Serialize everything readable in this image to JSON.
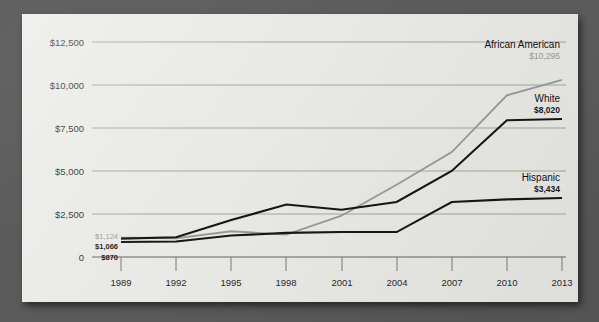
{
  "chart_data": {
    "type": "line",
    "title": "",
    "subtitle": "",
    "xlabel": "",
    "ylabel": "",
    "x": [
      1989,
      1992,
      1995,
      1998,
      2001,
      2004,
      2007,
      2010,
      2013
    ],
    "xtick_labels": [
      "1989",
      "1992",
      "1995",
      "1998",
      "2001",
      "2004",
      "2007",
      "2010",
      "2013"
    ],
    "ytick_labels": [
      "$12,500",
      "$10,000",
      "$7,500",
      "$5,000",
      "$2,500",
      "0"
    ],
    "ytick_values": [
      12500,
      10000,
      7500,
      5000,
      2500,
      0
    ],
    "ylim": [
      0,
      13500
    ],
    "grid": true,
    "legend_position": "inline-right-end-labels",
    "series": [
      {
        "name": "African American",
        "color": "#9a9a97",
        "values": [
          1124,
          1090,
          1500,
          1300,
          2400,
          4200,
          6100,
          9400,
          10295
        ],
        "start_label": "$1,124",
        "end_label": "$10,295"
      },
      {
        "name": "White",
        "color": "#161616",
        "values": [
          1066,
          1150,
          2150,
          3050,
          2750,
          3200,
          5000,
          7950,
          8020
        ],
        "start_label": "$1,066",
        "end_label": "$8,020"
      },
      {
        "name": "Hispanic",
        "color": "#161616",
        "values": [
          870,
          900,
          1250,
          1400,
          1450,
          1450,
          3200,
          3350,
          3434
        ],
        "start_label": "$870",
        "end_label": "$3,434"
      }
    ],
    "annotations": [
      {
        "text": "African American",
        "value": "$10,295"
      },
      {
        "text": "White",
        "value": "$8,020"
      },
      {
        "text": "Hispanic",
        "value": "$3,434"
      },
      {
        "text": "$1,124",
        "value": ""
      },
      {
        "text": "$1,066",
        "value": ""
      },
      {
        "text": "$870",
        "value": ""
      }
    ]
  },
  "colors": {
    "panel_background": "#e9e9e6",
    "surround_background": "#5b5b5b",
    "gridline": "#8d8d8a",
    "axis_text": "#2b2b2b",
    "series_gray": "#9a9a97",
    "series_dark": "#161616"
  }
}
